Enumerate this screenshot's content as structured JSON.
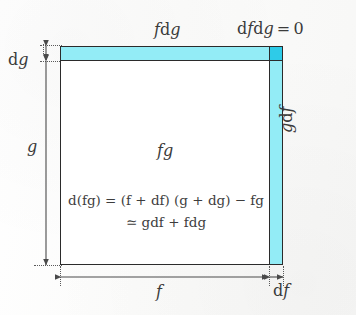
{
  "figure": {
    "type": "math-diagram",
    "background_color": "#fdfdfd",
    "ink_color": "#3a3a3a",
    "fill_light_cyan": "#93ecf6",
    "fill_dark_cyan": "#2ecbe8"
  },
  "labels": {
    "top_strip": "fdg",
    "corner_square": "dfdg = 0",
    "left_small_dimension": "dg",
    "left_large_dimension": "g",
    "right_strip": "gdf",
    "center_area": "fg",
    "bottom_large_dimension": "f",
    "bottom_small_dimension": "df"
  },
  "equation": {
    "line1": "d(fg) = (f + df) (g + dg) − fg",
    "line2": "≃ gdf + fdg"
  },
  "geometry": {
    "box_left": 60,
    "box_top": 46,
    "box_width": 223,
    "box_height": 219,
    "top_strip_height": 15,
    "right_strip_width": 14
  }
}
